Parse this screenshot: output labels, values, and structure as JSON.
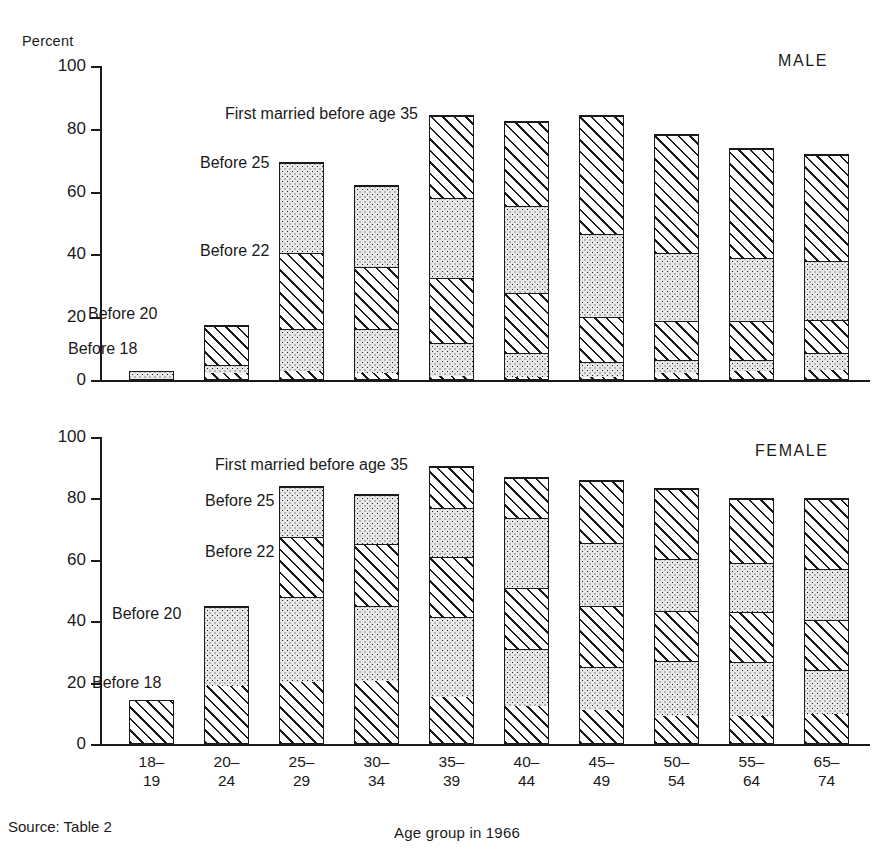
{
  "figure": {
    "y_axis_title": "Percent",
    "x_axis_title": "Age group in 1966",
    "source_note": "Source:  Table 2"
  },
  "panels": [
    {
      "id": "male",
      "sex_label": "MALE"
    },
    {
      "id": "female",
      "sex_label": "FEMALE"
    }
  ],
  "legend": {
    "before_18": "Before 18",
    "before_20": "Before 20",
    "before_22": "Before 22",
    "before_25": "Before 25",
    "before_35": "First married before age 35"
  },
  "y_ticks": {
    "male": [
      "100",
      "80",
      "60",
      "40",
      "20",
      "0"
    ],
    "female": [
      "100",
      "80",
      "60",
      "40",
      "20",
      "0"
    ]
  },
  "categories": [
    {
      "line1": "18–",
      "line2": "19"
    },
    {
      "line1": "20–",
      "line2": "24"
    },
    {
      "line1": "25–",
      "line2": "29"
    },
    {
      "line1": "30–",
      "line2": "34"
    },
    {
      "line1": "35–",
      "line2": "39"
    },
    {
      "line1": "40–",
      "line2": "44"
    },
    {
      "line1": "45–",
      "line2": "49"
    },
    {
      "line1": "50–",
      "line2": "54"
    },
    {
      "line1": "55–",
      "line2": "64"
    },
    {
      "line1": "65–",
      "line2": "74"
    }
  ],
  "chart_data": {
    "type": "bar",
    "subtitle": "",
    "xlabel": "Age group in 1966",
    "ylabel": "Percent",
    "ylim": [
      0,
      100
    ],
    "grid": false,
    "stacked": true,
    "legend_position": "in-plot annotations",
    "categories": [
      "18-19",
      "20-24",
      "25-29",
      "30-34",
      "35-39",
      "40-44",
      "45-49",
      "50-54",
      "55-64",
      "65-74"
    ],
    "cumulative_series_order": [
      "Before 18",
      "Before 20",
      "Before 22",
      "Before 25",
      "First married before age 35"
    ],
    "panels": [
      {
        "name": "MALE",
        "cumulative": {
          "Before 18": [
            0.0,
            2.0,
            2.5,
            2.0,
            1.0,
            0.5,
            0.5,
            2.0,
            2.5,
            3.0
          ],
          "Before 20": [
            3.0,
            4.5,
            16.0,
            16.0,
            11.5,
            8.5,
            5.5,
            6.0,
            6.0,
            8.5
          ],
          "Before 22": [
            3.0,
            17.5,
            40.5,
            36.0,
            32.5,
            27.5,
            20.0,
            18.5,
            18.5,
            19.0
          ],
          "Before 25": [
            3.0,
            17.5,
            69.5,
            62.0,
            58.0,
            55.5,
            46.5,
            40.5,
            39.0,
            38.0
          ],
          "First married before age 35": [
            3.0,
            17.5,
            69.5,
            62.0,
            84.5,
            82.5,
            84.5,
            78.5,
            74.0,
            72.0
          ]
        },
        "segment_values": {
          "Before 18": [
            0.0,
            2.0,
            2.5,
            2.0,
            1.0,
            0.5,
            0.5,
            2.0,
            2.5,
            3.0
          ],
          "18 to 20": [
            3.0,
            2.5,
            13.5,
            14.0,
            10.5,
            8.0,
            5.0,
            4.0,
            3.5,
            5.5
          ],
          "20 to 22": [
            0.0,
            13.0,
            24.5,
            20.0,
            21.0,
            19.0,
            14.5,
            12.5,
            12.5,
            10.5
          ],
          "22 to 25": [
            0.0,
            0.0,
            29.0,
            26.0,
            25.5,
            28.0,
            26.5,
            22.0,
            20.5,
            19.0
          ],
          "25 to 35": [
            0.0,
            0.0,
            0.0,
            0.0,
            26.5,
            27.0,
            38.0,
            38.0,
            35.0,
            34.0
          ]
        },
        "bar_totals": [
          3.0,
          17.5,
          69.5,
          62.0,
          84.5,
          82.5,
          84.5,
          78.5,
          74.0,
          72.0
        ]
      },
      {
        "name": "FEMALE",
        "cumulative": {
          "Before 18": [
            14.5,
            19.0,
            20.0,
            20.5,
            15.0,
            12.0,
            11.0,
            9.0,
            9.0,
            9.5
          ],
          "Before 20": [
            14.5,
            45.0,
            48.0,
            45.0,
            41.5,
            31.0,
            25.0,
            27.0,
            26.5,
            24.0
          ],
          "Before 22": [
            14.5,
            45.0,
            67.5,
            65.5,
            61.0,
            51.0,
            45.0,
            43.5,
            43.0,
            40.5
          ],
          "Before 25": [
            14.5,
            45.0,
            84.0,
            81.5,
            77.0,
            74.0,
            65.5,
            60.5,
            59.0,
            57.0
          ],
          "First married before age 35": [
            14.5,
            45.0,
            84.0,
            81.5,
            90.5,
            87.0,
            86.0,
            83.5,
            80.0,
            80.0
          ]
        },
        "segment_values": {
          "Before 18": [
            14.5,
            19.0,
            20.0,
            20.5,
            15.0,
            12.0,
            11.0,
            9.0,
            9.0,
            9.5
          ],
          "18 to 20": [
            0.0,
            26.0,
            28.0,
            24.5,
            26.5,
            19.0,
            14.0,
            18.0,
            17.5,
            14.5
          ],
          "20 to 22": [
            0.0,
            0.0,
            19.5,
            20.5,
            19.5,
            20.0,
            20.0,
            16.5,
            16.5,
            16.5
          ],
          "22 to 25": [
            0.0,
            0.0,
            16.5,
            16.0,
            16.0,
            23.0,
            20.5,
            17.0,
            16.0,
            16.5
          ],
          "25 to 35": [
            0.0,
            0.0,
            0.0,
            0.0,
            13.5,
            13.0,
            20.5,
            23.0,
            21.0,
            23.0
          ]
        },
        "bar_totals": [
          14.5,
          45.0,
          84.0,
          81.5,
          90.5,
          87.0,
          86.0,
          83.5,
          80.0,
          80.0
        ]
      }
    ],
    "fill_patterns": {
      "Before 18": "diagonal-hatch",
      "18 to 20": "dotted-stipple",
      "20 to 22": "diagonal-hatch",
      "22 to 25": "dotted-stipple",
      "25 to 35": "diagonal-hatch"
    }
  }
}
